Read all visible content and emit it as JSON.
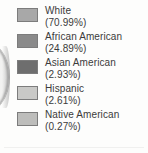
{
  "chart_data": {
    "type": "pie",
    "title": "",
    "subtitle": "",
    "xlabel": "",
    "ylabel": "",
    "legend_position": "right",
    "grid": false,
    "units": "percent",
    "categories": [
      "White",
      "African American",
      "Asian American",
      "Hispanic",
      "Native American"
    ],
    "values": [
      70.99,
      24.89,
      2.93,
      2.61,
      0.27
    ],
    "colors": [
      "#a8a8a8",
      "#8a8a8a",
      "#6e6e6e",
      "#c9c9c7",
      "#bdbdbb"
    ],
    "legend_entries": [
      {
        "label": "White",
        "value_text": "(70.99%)",
        "value": 70.99,
        "color": "#a8a8a8",
        "swatch_name": "legend-swatch-white"
      },
      {
        "label": "African American",
        "value_text": "(24.89%)",
        "value": 24.89,
        "color": "#8a8a8a",
        "swatch_name": "legend-swatch-african-american"
      },
      {
        "label": "Asian American",
        "value_text": "(2.93%)",
        "value": 2.93,
        "color": "#6e6e6e",
        "swatch_name": "legend-swatch-asian-american"
      },
      {
        "label": "Hispanic",
        "value_text": "(2.61%)",
        "value": 2.61,
        "color": "#c9c9c7",
        "swatch_name": "legend-swatch-hispanic"
      },
      {
        "label": "Native American",
        "value_text": "(0.27%)",
        "value": 0.27,
        "color": "#bdbdbb",
        "swatch_name": "legend-swatch-native-american"
      }
    ]
  },
  "figure": {
    "background": "#fdfdfc",
    "text_color": "#3b3b3b",
    "pie_edge_fill": "#f2f2f1",
    "rule_color": "#f0f0ef"
  }
}
